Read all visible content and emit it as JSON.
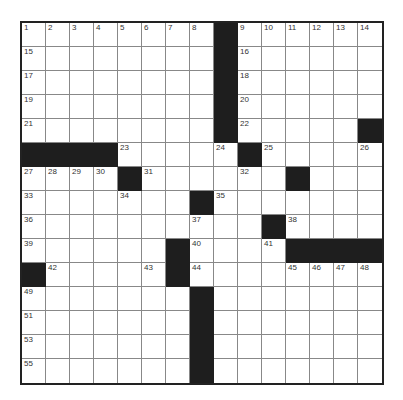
{
  "puzzle": {
    "rows": 15,
    "cols": 15,
    "colors": {
      "black": "#1e1e1e",
      "white": "#ffffff",
      "line": "#888888",
      "border": "#222222"
    },
    "grid": [
      "........#......",
      "........#......",
      "........#......",
      "........#......",
      "........#.....#",
      "####.....#.....",
      "....#......#...",
      ".......#.......",
      "..........#....",
      "......#....####",
      "#.....#........",
      ".......#.......",
      ".......#.......",
      ".......#.......",
      ".......#......."
    ],
    "numbers": [
      {
        "r": 0,
        "c": 0,
        "n": "1"
      },
      {
        "r": 0,
        "c": 1,
        "n": "2"
      },
      {
        "r": 0,
        "c": 2,
        "n": "3"
      },
      {
        "r": 0,
        "c": 3,
        "n": "4"
      },
      {
        "r": 0,
        "c": 4,
        "n": "5"
      },
      {
        "r": 0,
        "c": 5,
        "n": "6"
      },
      {
        "r": 0,
        "c": 6,
        "n": "7"
      },
      {
        "r": 0,
        "c": 7,
        "n": "8"
      },
      {
        "r": 0,
        "c": 9,
        "n": "9"
      },
      {
        "r": 0,
        "c": 10,
        "n": "10"
      },
      {
        "r": 0,
        "c": 11,
        "n": "11"
      },
      {
        "r": 0,
        "c": 12,
        "n": "12"
      },
      {
        "r": 0,
        "c": 13,
        "n": "13"
      },
      {
        "r": 0,
        "c": 14,
        "n": "14"
      },
      {
        "r": 1,
        "c": 0,
        "n": "15"
      },
      {
        "r": 1,
        "c": 9,
        "n": "16"
      },
      {
        "r": 2,
        "c": 0,
        "n": "17"
      },
      {
        "r": 2,
        "c": 9,
        "n": "18"
      },
      {
        "r": 3,
        "c": 0,
        "n": "19"
      },
      {
        "r": 3,
        "c": 9,
        "n": "20"
      },
      {
        "r": 4,
        "c": 0,
        "n": "21"
      },
      {
        "r": 4,
        "c": 9,
        "n": "22"
      },
      {
        "r": 5,
        "c": 4,
        "n": "23"
      },
      {
        "r": 5,
        "c": 8,
        "n": "24"
      },
      {
        "r": 5,
        "c": 10,
        "n": "25"
      },
      {
        "r": 5,
        "c": 14,
        "n": "26"
      },
      {
        "r": 6,
        "c": 0,
        "n": "27"
      },
      {
        "r": 6,
        "c": 1,
        "n": "28"
      },
      {
        "r": 6,
        "c": 2,
        "n": "29"
      },
      {
        "r": 6,
        "c": 3,
        "n": "30"
      },
      {
        "r": 6,
        "c": 5,
        "n": "31"
      },
      {
        "r": 6,
        "c": 9,
        "n": "32"
      },
      {
        "r": 7,
        "c": 0,
        "n": "33"
      },
      {
        "r": 7,
        "c": 4,
        "n": "34"
      },
      {
        "r": 7,
        "c": 8,
        "n": "35"
      },
      {
        "r": 8,
        "c": 0,
        "n": "36"
      },
      {
        "r": 8,
        "c": 7,
        "n": "37"
      },
      {
        "r": 8,
        "c": 11,
        "n": "38"
      },
      {
        "r": 9,
        "c": 0,
        "n": "39"
      },
      {
        "r": 9,
        "c": 7,
        "n": "40"
      },
      {
        "r": 9,
        "c": 10,
        "n": "41"
      },
      {
        "r": 10,
        "c": 1,
        "n": "42"
      },
      {
        "r": 10,
        "c": 5,
        "n": "43"
      },
      {
        "r": 10,
        "c": 7,
        "n": "44"
      },
      {
        "r": 10,
        "c": 11,
        "n": "45"
      },
      {
        "r": 10,
        "c": 12,
        "n": "46"
      },
      {
        "r": 10,
        "c": 13,
        "n": "47"
      },
      {
        "r": 10,
        "c": 14,
        "n": "48"
      },
      {
        "r": 11,
        "c": 0,
        "n": "49"
      },
      {
        "r": 11,
        "c": 7,
        "n": "50"
      },
      {
        "r": 12,
        "c": 0,
        "n": "51"
      },
      {
        "r": 12,
        "c": 7,
        "n": "52"
      },
      {
        "r": 13,
        "c": 0,
        "n": "53"
      },
      {
        "r": 13,
        "c": 7,
        "n": "54"
      },
      {
        "r": 14,
        "c": 0,
        "n": "55"
      },
      {
        "r": 14,
        "c": 7,
        "n": "56"
      }
    ]
  }
}
